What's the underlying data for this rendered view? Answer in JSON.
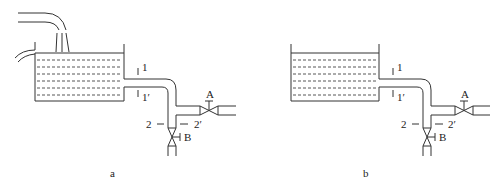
{
  "diagrams": [
    {
      "caption": "a",
      "has_inflow": true,
      "labels": {
        "section1": "1",
        "section1p": "1′",
        "section2": "2",
        "section2p": "2′",
        "valveA": "A",
        "valveB": "B"
      }
    },
    {
      "caption": "b",
      "has_inflow": false,
      "labels": {
        "section1": "1",
        "section1p": "1′",
        "section2": "2",
        "section2p": "2′",
        "valveA": "A",
        "valveB": "B"
      }
    }
  ],
  "colors": {
    "line": "#333333",
    "background": "#ffffff"
  }
}
